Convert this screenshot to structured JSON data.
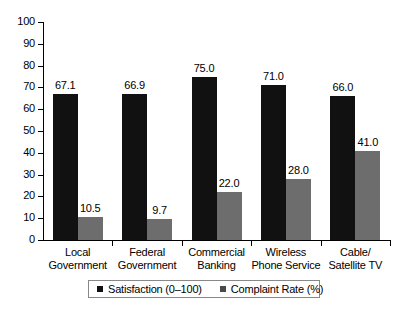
{
  "chart_data": {
    "type": "bar",
    "title": "",
    "subtitle": "",
    "xlabel": "",
    "ylabel": "",
    "ylim": [
      0,
      100
    ],
    "ytick_labels": [
      "100",
      "90",
      "80",
      "70",
      "60",
      "50",
      "40",
      "30",
      "20",
      "10",
      "0"
    ],
    "ytick_values": [
      100,
      90,
      80,
      70,
      60,
      50,
      40,
      30,
      20,
      10,
      0
    ],
    "grid": false,
    "legend_position": "bottom",
    "categories": [
      "Local Government",
      "Federal Government",
      "Commercial Banking",
      "Wireless Phone Service",
      "Cable/ Satellite TV"
    ],
    "category_lines": [
      [
        "Local",
        "Government"
      ],
      [
        "Federal",
        "Government"
      ],
      [
        "Commercial",
        "Banking"
      ],
      [
        "Wireless",
        "Phone Service"
      ],
      [
        "Cable/",
        "Satellite TV"
      ]
    ],
    "series": [
      {
        "name": "Satisfaction (0–100)",
        "color": "#111111",
        "values": [
          67.1,
          66.9,
          75.0,
          71.0,
          66.0
        ],
        "value_labels": [
          "67.1",
          "66.9",
          "75.0",
          "71.0",
          "66.0"
        ]
      },
      {
        "name": "Complaint Rate (%)",
        "color": "#6d6d6d",
        "values": [
          10.5,
          9.7,
          22.0,
          28.0,
          41.0
        ],
        "value_labels": [
          "10.5",
          "9.7",
          "22.0",
          "28.0",
          "41.0"
        ]
      }
    ]
  },
  "legend": {
    "entries": [
      {
        "label": "Satisfaction (0–100)"
      },
      {
        "label": "Complaint Rate (%)"
      }
    ]
  }
}
